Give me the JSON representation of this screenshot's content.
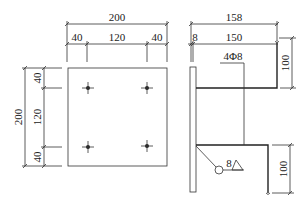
{
  "diagram": {
    "type": "embedded steel plate detail (plan and section)",
    "plan_view": {
      "top_dims": {
        "overall": "200",
        "left": "40",
        "middle": "120",
        "right": "40"
      },
      "left_dims": {
        "overall": "200",
        "top": "40",
        "middle": "120",
        "bottom": "40"
      },
      "holes": 4
    },
    "section_view": {
      "top_dims": {
        "overall": "158",
        "plate": "8",
        "anchor": "150"
      },
      "anchor_label": "4Φ8",
      "right_dims": {
        "upper": "100",
        "lower": "100"
      },
      "weld_size": "8"
    }
  }
}
